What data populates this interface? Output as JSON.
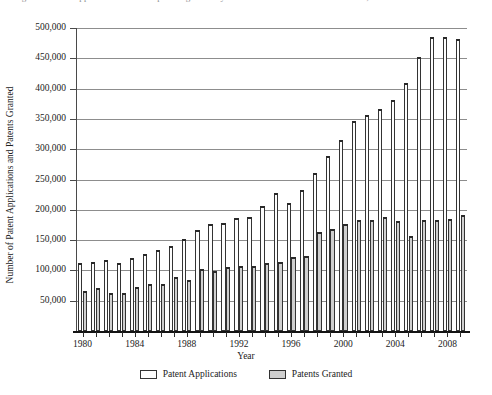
{
  "caption": {
    "text": "Figure 1.  Patent applications filed and patents granted by the U.S. Patent and Trademark Office, 1980–2009",
    "visible_note": "clipped-at-top-edge"
  },
  "colors": {
    "applications_fill": "#fdfdfd",
    "granted_fill": "#cfcfcf",
    "bar_outline": "#333333",
    "gridline": "#8d8d8d",
    "axis": "#141414",
    "text": "#222222"
  },
  "legend": {
    "position": "bottom-center",
    "items": [
      {
        "label": "Patent Applications",
        "swatch": "applications_fill"
      },
      {
        "label": "Patents Granted",
        "swatch": "granted_fill"
      }
    ]
  },
  "axes": {
    "x_title": "Year",
    "y_title": "Number of Patent Applications and Patents Granted",
    "y_tick_labels": [
      "50,000",
      "100,000",
      "150,000",
      "200,000",
      "250,000",
      "300,000",
      "350,000",
      "400,000",
      "450,000",
      "500,000"
    ],
    "y_tick_values": [
      50000,
      100000,
      150000,
      200000,
      250000,
      300000,
      350000,
      400000,
      450000,
      500000
    ],
    "x_tick_labels": [
      "1980",
      "1984",
      "1988",
      "1992",
      "1996",
      "2000",
      "2004",
      "2008"
    ]
  },
  "chart_data": {
    "type": "bar",
    "title": "Patent applications filed and patents granted by the U.S. Patent and Trademark Office, 1980–2009",
    "xlabel": "Year",
    "ylabel": "Number of Patent Applications and Patents Granted",
    "ylim": [
      0,
      500000
    ],
    "ytick_step": 50000,
    "grid": true,
    "legend_position": "bottom-center",
    "categories": [
      "1980",
      "1981",
      "1982",
      "1983",
      "1984",
      "1985",
      "1986",
      "1987",
      "1988",
      "1989",
      "1990",
      "1991",
      "1992",
      "1993",
      "1994",
      "1995",
      "1996",
      "1997",
      "1998",
      "1999",
      "2000",
      "2001",
      "2002",
      "2003",
      "2004",
      "2005",
      "2006",
      "2007",
      "2008",
      "2009"
    ],
    "series": [
      {
        "name": "Patent Applications",
        "values": [
          113000,
          114000,
          118000,
          112000,
          121000,
          127000,
          133000,
          140000,
          152000,
          166000,
          176000,
          178000,
          187000,
          188000,
          206000,
          228000,
          212000,
          233000,
          261000,
          289000,
          315000,
          346000,
          357000,
          367000,
          382000,
          409000,
          452000,
          485000,
          485000,
          482000
        ]
      },
      {
        "name": "Patents Granted",
        "values": [
          66000,
          71000,
          63000,
          62000,
          72000,
          77000,
          77000,
          89000,
          84000,
          102000,
          99000,
          106000,
          108000,
          107000,
          113000,
          114000,
          122000,
          124000,
          163000,
          169000,
          176000,
          184000,
          184000,
          188000,
          181000,
          157000,
          183000,
          183000,
          185000,
          192000
        ]
      }
    ]
  }
}
